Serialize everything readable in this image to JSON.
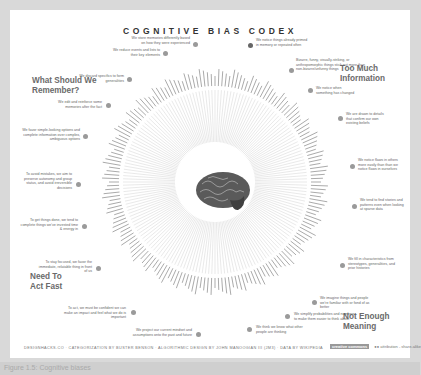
{
  "title": "COGNITIVE BIAS CODEX",
  "quadrants": {
    "top_left": [
      "What Should We",
      "Remember?"
    ],
    "top_right": [
      "Too Much",
      "Information"
    ],
    "bottom_left": [
      "Need To",
      "Act Fast"
    ],
    "bottom_right": [
      "Not Enough",
      "Meaning"
    ]
  },
  "notes": [
    {
      "id": "store",
      "text": "We store memories differently based on how they were experienced"
    },
    {
      "id": "reduce",
      "text": "We reduce events and lists to their key elements"
    },
    {
      "id": "discard",
      "text": "We discard specifics to form generalities"
    },
    {
      "id": "edit",
      "text": "We edit and reinforce some memories after the fact"
    },
    {
      "id": "simple",
      "text": "We favor simple-looking options and complete information over complex, ambiguous options"
    },
    {
      "id": "avoid",
      "text": "To avoid mistakes, we aim to preserve autonomy and group status, and avoid irreversible decisions"
    },
    {
      "id": "getdone",
      "text": "To get things done, we tend to complete things we've invested time & energy in"
    },
    {
      "id": "focus",
      "text": "To stay focused, we favor the immediate, relatable thing in front of us"
    },
    {
      "id": "act",
      "text": "To act, we must be confident we can make an impact and feel what we do is important"
    },
    {
      "id": "project",
      "text": "We project our current mindset and assumptions onto the past and future"
    },
    {
      "id": "think",
      "text": "We think we know what other people are thinking"
    },
    {
      "id": "probs",
      "text": "We simplify probabilities and numbers to make them easier to think about"
    },
    {
      "id": "imagine",
      "text": "We imagine things and people we're familiar with or fond of as better"
    },
    {
      "id": "fillin",
      "text": "We fill in characteristics from stereotypes, generalities, and prior histories"
    },
    {
      "id": "stories",
      "text": "We tend to find stories and patterns even when looking at sparse data"
    },
    {
      "id": "flaws",
      "text": "We notice flaws in others more easily than than we notice flaws in ourselves"
    },
    {
      "id": "drawn",
      "text": "We are drawn to details that confirm our own existing beliefs"
    },
    {
      "id": "changed",
      "text": "We notice when something has changed"
    },
    {
      "id": "bizarre",
      "text": "Bizarre, funny, visually-striking, or anthropomorphic things stick out more than non-bizarre/unfunny things"
    },
    {
      "id": "primed",
      "text": "We notice things already primed in memory or repeated often"
    }
  ],
  "footer": "DESIGNHACKS.CO · CATEGORIZATION BY BUSTER BENSON · ALGORITHMIC DESIGN BY JOHN MANOOGIAN III (JM3) · DATA BY WIKIPEDIA",
  "license": {
    "badge": "creative commons",
    "text": "attribution - share-alike"
  },
  "caption": "Figure 1.5: Cognitive biases"
}
